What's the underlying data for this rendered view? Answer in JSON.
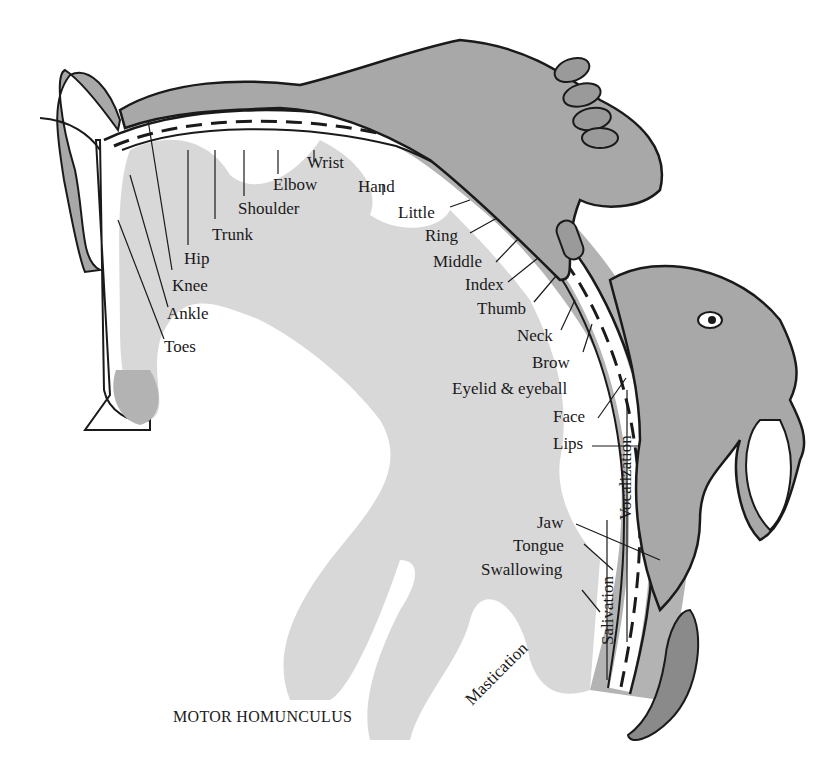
{
  "title": "MOTOR HOMUNCULUS",
  "colors": {
    "cortex_gray": "#b3b3b3",
    "body_gray": "#a8a8a8",
    "tongue_dark": "#8a8a8a",
    "line": "#1a1a1a",
    "background": "#ffffff"
  },
  "labels": {
    "toes": "Toes",
    "ankle": "Ankle",
    "knee": "Knee",
    "hip": "Hip",
    "trunk": "Trunk",
    "shoulder": "Shoulder",
    "elbow": "Elbow",
    "wrist": "Wrist",
    "hand": "Hand",
    "little": "Little",
    "ring": "Ring",
    "middle": "Middle",
    "index": "Index",
    "thumb": "Thumb",
    "neck": "Neck",
    "brow": "Brow",
    "eyelid_eyeball": "Eyelid & eyeball",
    "face": "Face",
    "lips": "Lips",
    "jaw": "Jaw",
    "tongue": "Tongue",
    "swallowing": "Swallowing",
    "vocalization": "Vocalization",
    "salivation": "Salivation",
    "mastication": "Mastication"
  }
}
